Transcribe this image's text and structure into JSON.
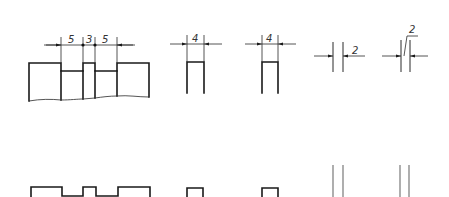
{
  "figure": {
    "colors": {
      "outline": "#1a1a1a",
      "thin": "#2a2a2a",
      "gray": "#7a7a7a",
      "background": "#ffffff"
    }
  },
  "top_row": {
    "grooved_part": {
      "dims": [
        {
          "label": "5",
          "x": 72,
          "y": 43
        },
        {
          "label": "3",
          "x": 89,
          "y": 43
        },
        {
          "label": "5",
          "x": 106,
          "y": 43
        }
      ]
    },
    "slot_1": {
      "dim_label": "4",
      "label_x": 195,
      "label_y": 42
    },
    "slot_2": {
      "dim_label": "4",
      "label_x": 270,
      "label_y": 42
    },
    "gap_1": {
      "dim_label": "2",
      "label_x": 355,
      "label_y": 54
    },
    "gap_2": {
      "dim_label": "2",
      "label_x": 411,
      "label_y": 31
    }
  },
  "bottom_row": {
    "grooved_profile": "outline",
    "slot_1": "outline",
    "slot_2": "outline",
    "gap_1": "double-line",
    "gap_2": "double-line"
  }
}
